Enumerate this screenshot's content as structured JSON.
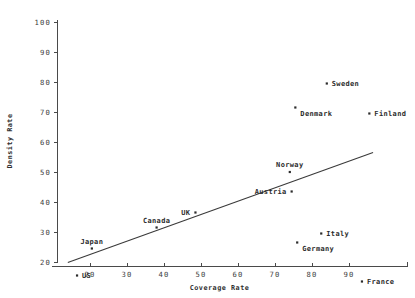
{
  "chart_data": {
    "type": "scatter",
    "title": "",
    "xlabel": "Coverage Rate",
    "ylabel": "Density Rate",
    "xlim": [
      13,
      97
    ],
    "ylim": [
      12,
      101
    ],
    "xticks": [
      20,
      30,
      40,
      50,
      60,
      70,
      80,
      90
    ],
    "xtick_labels": [
      "20",
      "30",
      "40",
      "50",
      "60",
      "70",
      "80",
      "90"
    ],
    "yticks": [
      20,
      30,
      40,
      50,
      60,
      70,
      80,
      90,
      100
    ],
    "ytick_labels": [
      "20",
      "30",
      "40",
      "50",
      "60",
      "70",
      "80",
      "90",
      "100"
    ],
    "grid": false,
    "legend": "none",
    "points": [
      {
        "label": "US",
        "x": 16.5,
        "y": 15.5,
        "label_pos": "right"
      },
      {
        "label": "Japan",
        "x": 20.5,
        "y": 24.5,
        "label_pos": "above"
      },
      {
        "label": "Canada",
        "x": 38.0,
        "y": 31.5,
        "label_pos": "above"
      },
      {
        "label": "UK",
        "x": 48.5,
        "y": 36.5,
        "label_pos": "left"
      },
      {
        "label": "Austria",
        "x": 74.5,
        "y": 43.5,
        "label_pos": "left"
      },
      {
        "label": "Norway",
        "x": 74.0,
        "y": 50.0,
        "label_pos": "above"
      },
      {
        "label": "Germany",
        "x": 76.0,
        "y": 26.5,
        "label_pos": "below-right"
      },
      {
        "label": "Italy",
        "x": 82.5,
        "y": 29.5,
        "label_pos": "right"
      },
      {
        "label": "Denmark",
        "x": 75.5,
        "y": 71.5,
        "label_pos": "below-right"
      },
      {
        "label": "Sweden",
        "x": 84.0,
        "y": 79.5,
        "label_pos": "right"
      },
      {
        "label": "Finland",
        "x": 95.5,
        "y": 69.5,
        "label_pos": "right"
      },
      {
        "label": "France",
        "x": 93.5,
        "y": 13.5,
        "label_pos": "right"
      }
    ],
    "trend_line": {
      "x_start": 14.0,
      "y_start": 19.8,
      "x_end": 96.5,
      "y_end": 56.5
    }
  }
}
